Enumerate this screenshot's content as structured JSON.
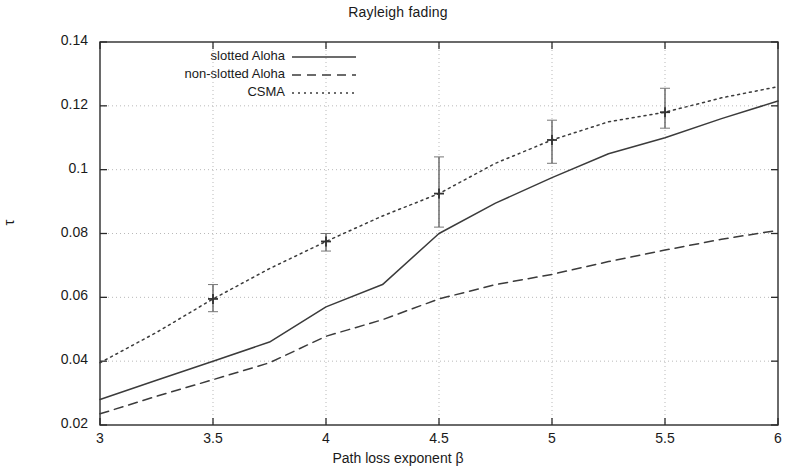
{
  "chart_data": {
    "type": "line",
    "title": "Rayleigh fading",
    "xlabel": "Path loss exponent β",
    "ylabel": "τ",
    "xlim": [
      3,
      6
    ],
    "ylim": [
      0.02,
      0.14
    ],
    "grid": true,
    "legend_position": "top-left-inside",
    "xticks": [
      "3",
      "3.5",
      "4",
      "4.5",
      "5",
      "5.5",
      "6"
    ],
    "xtick_values": [
      3,
      3.5,
      4,
      4.5,
      5,
      5.5,
      6
    ],
    "yticks": [
      "0.02",
      "0.04",
      "0.06",
      "0.08",
      "0.1",
      "0.12",
      "0.14"
    ],
    "ytick_values": [
      0.02,
      0.04,
      0.06,
      0.08,
      0.1,
      0.12,
      0.14
    ],
    "x": [
      3,
      3.25,
      3.5,
      3.75,
      4,
      4.25,
      4.5,
      4.75,
      5,
      5.25,
      5.5,
      5.75,
      6
    ],
    "series": [
      {
        "name": "slotted Aloha",
        "style": "solid",
        "color": "#3b3b3b",
        "values": [
          0.028,
          0.034,
          0.04,
          0.046,
          0.057,
          0.064,
          0.08,
          0.0895,
          0.0975,
          0.105,
          0.11,
          0.116,
          0.1215
        ]
      },
      {
        "name": "non-slotted Aloha",
        "style": "dashed",
        "color": "#3b3b3b",
        "values": [
          0.0235,
          0.029,
          0.0342,
          0.0395,
          0.0478,
          0.053,
          0.0595,
          0.064,
          0.0672,
          0.0712,
          0.0748,
          0.0782,
          0.081
        ]
      },
      {
        "name": "CSMA",
        "style": "dotted",
        "color": "#3b3b3b",
        "values": [
          0.0395,
          0.049,
          0.0595,
          0.069,
          0.0775,
          0.0855,
          0.0925,
          0.102,
          0.1093,
          0.115,
          0.118,
          0.1225,
          0.126
        ],
        "errorbars": [
          {
            "x": 3.5,
            "y": 0.0595,
            "low": 0.0555,
            "high": 0.064
          },
          {
            "x": 4.0,
            "y": 0.0775,
            "low": 0.0745,
            "high": 0.08
          },
          {
            "x": 4.5,
            "y": 0.0925,
            "low": 0.082,
            "high": 0.104
          },
          {
            "x": 5.0,
            "y": 0.1093,
            "low": 0.102,
            "high": 0.1155
          },
          {
            "x": 5.5,
            "y": 0.118,
            "low": 0.113,
            "high": 0.1255
          }
        ]
      }
    ]
  },
  "legend": {
    "items": [
      {
        "label": "slotted Aloha",
        "style": "solid"
      },
      {
        "label": "non-slotted Aloha",
        "style": "dashed"
      },
      {
        "label": "CSMA",
        "style": "dotted"
      }
    ]
  },
  "colors": {
    "axis": "#2b2b2b",
    "grid": "#b9b9b9",
    "line": "#3b3b3b",
    "background": "#ffffff"
  }
}
